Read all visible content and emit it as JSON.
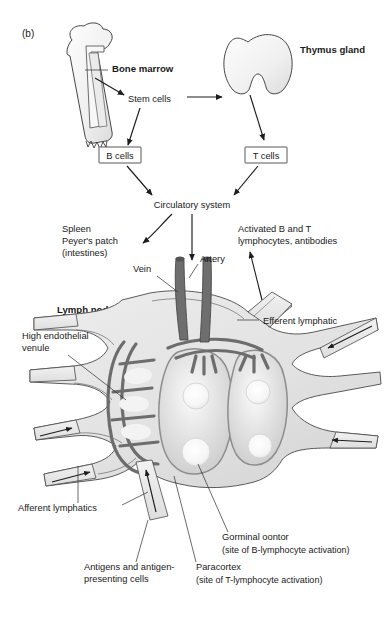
{
  "figure": {
    "panel_label": "(b)",
    "domain": "immunology-diagram"
  },
  "upper_pathway": {
    "bone_marrow_label": "Bone marrow",
    "thymus_label": "Thymus gland",
    "stem_cells_label": "Stem cells",
    "b_cells_label": "B cells",
    "t_cells_label": "T cells",
    "circulatory_label": "Circulatory system",
    "secondary_organs": {
      "line1": "Spleen",
      "line2": "Peyer's patch",
      "line3": "(intestines)"
    },
    "output_products": {
      "line1": "Activated B and T",
      "line2": "lymphocytes, antibodies"
    }
  },
  "lymph_node": {
    "title": "Lymph node",
    "vein_label": "Vein",
    "artery_label": "Artery",
    "efferent_label": "Efferent lymphatic",
    "hev": {
      "line1": "High endothelial",
      "line2": "venule"
    },
    "afferent_label": "Afferent lymphatics",
    "antigens": {
      "line1": "Antigens and antigen-",
      "line2": "presenting cells"
    },
    "germinal_center": {
      "line1": "Gorminal oontor",
      "line2": "(site of B-lymphocyte activation)"
    },
    "paracortex": {
      "line1": "Paracortex",
      "line2": "(site of T-lymphocyte activation)"
    }
  },
  "colors": {
    "ink": "#1a1a1a",
    "node_fill": "#e2e2e2",
    "follicle_fill": "#d8d8d8",
    "vessel": "#6e6e6e",
    "outline": "#4a4a4a",
    "background": "#ffffff"
  }
}
